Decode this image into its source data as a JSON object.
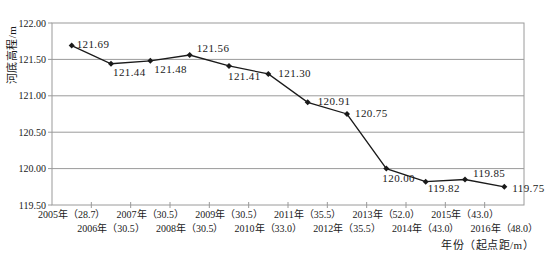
{
  "chart_data": {
    "type": "line",
    "title": "",
    "xlabel": "年份（起点距/m）",
    "ylabel": "河底高程/m",
    "ylim": [
      119.5,
      122.0
    ],
    "ytick_step": 0.5,
    "yticks": [
      "122.00",
      "121.50",
      "121.00",
      "120.50",
      "120.00",
      "119.50"
    ],
    "categories": [
      "2005年（28.7）",
      "2006年（30.5）",
      "2007年（30.5）",
      "2008年（30.5）",
      "2009年（30.5）",
      "2010年（33.0）",
      "2011年（35.5）",
      "2012年（35.5）",
      "2013年（52.0）",
      "2014年（43.0）",
      "2015年（43.0）",
      "2016年（48.0）"
    ],
    "values": [
      121.69,
      121.44,
      121.48,
      121.56,
      121.41,
      121.3,
      120.91,
      120.75,
      120.0,
      119.82,
      119.85,
      119.75
    ],
    "data_labels": [
      "121.69",
      "121.44",
      "121.48",
      "121.56",
      "121.41",
      "121.30",
      "120.91",
      "120.75",
      "120.00",
      "119.82",
      "119.85",
      "119.75"
    ],
    "grid": "horizontal",
    "legend": "none",
    "marker": "diamond",
    "line_color": "#1a1a1a",
    "grid_color": "#9a9a9a",
    "text_color": "#1a1a1a",
    "label_offsets": [
      [
        5,
        2
      ],
      [
        2,
        12
      ],
      [
        4,
        12
      ],
      [
        7,
        -3
      ],
      [
        -1,
        14
      ],
      [
        10,
        3
      ],
      [
        10,
        3
      ],
      [
        8,
        3
      ],
      [
        -4,
        13
      ],
      [
        2,
        10
      ],
      [
        8,
        -3
      ],
      [
        8,
        5
      ]
    ],
    "x_label_stagger": "even-top-odd-bottom"
  }
}
